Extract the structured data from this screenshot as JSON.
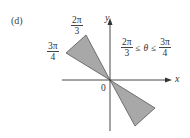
{
  "panel": {
    "label": "(d)"
  },
  "axes": {
    "x_label": "x",
    "y_label": "y",
    "origin_label": "0"
  },
  "ray_labels": {
    "upper": {
      "numerator": "2π",
      "denominator": "3"
    },
    "lower": {
      "numerator": "3π",
      "denominator": "4"
    }
  },
  "inequality": {
    "left": {
      "numerator": "2π",
      "denominator": "3"
    },
    "op1": "≤",
    "variable": "θ",
    "op2": "≤",
    "right": {
      "numerator": "3π",
      "denominator": "4"
    }
  },
  "colors": {
    "region_fill": "#a8a8a8",
    "region_stroke": "#555555",
    "axis": "#333333",
    "text": "#333333"
  }
}
